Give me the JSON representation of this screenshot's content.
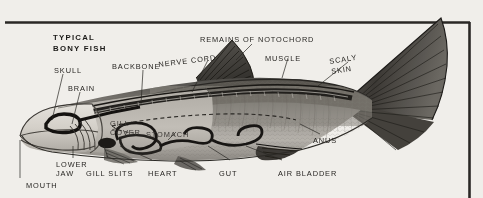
{
  "figure": {
    "title_line1": "TYPICAL",
    "title_line2": "BONY FISH",
    "medium": "halftone-scan",
    "paper_color": "#f3f1ed",
    "ink_color": "#272522",
    "frame": {
      "top_rule": true,
      "right_rule": true,
      "color": "#2b2926"
    }
  },
  "labels": {
    "skull": "SKULL",
    "brain": "BRAIN",
    "backbone": "BACKBONE",
    "nerve_cord": "NERVE CORD",
    "remains_of_notochord": "REMAINS OF NOTOCHORD",
    "muscle": "MUSCLE",
    "scaly_skin_1": "SCALY",
    "scaly_skin_2": "SKIN",
    "gill_cover_1": "GILL",
    "gill_cover_2": "COVER",
    "stomach": "STOMACH",
    "anus": "ANUS",
    "lower_1": "LOWER",
    "lower_2": "JAW",
    "gill_slits": "GILL SLITS",
    "heart": "HEART",
    "gut": "GUT",
    "air_bladder": "AIR BLADDER",
    "mouth": "MOUTH"
  },
  "anatomy_parts": [
    "skull",
    "brain",
    "backbone",
    "nerve cord",
    "remains of notochord",
    "muscle",
    "scaly skin",
    "gill cover",
    "stomach",
    "anus",
    "lower jaw",
    "gill slits",
    "heart",
    "gut",
    "air bladder",
    "mouth"
  ]
}
